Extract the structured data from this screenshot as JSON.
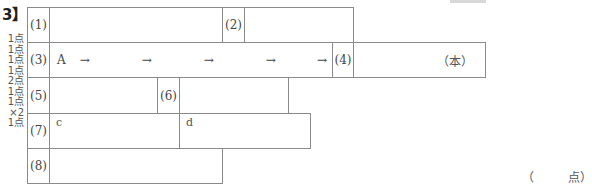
{
  "section": {
    "header": "3】",
    "scores": [
      "1点",
      "1点",
      "1点",
      "1点",
      "2点",
      "1点",
      "1点",
      "×2",
      "1点"
    ]
  },
  "questions": {
    "q1": {
      "label": "(1)",
      "answer": ""
    },
    "q2": {
      "label": "(2)",
      "answer": ""
    },
    "q3": {
      "label": "(3)",
      "start": "A",
      "arrow": "→",
      "end": "B",
      "blanks": [
        "",
        "",
        "",
        ""
      ]
    },
    "q4": {
      "label": "(4)",
      "answer": "",
      "unit": "（本）"
    },
    "q5": {
      "label": "(5)",
      "answer": ""
    },
    "q6": {
      "label": "(6)",
      "answer": ""
    },
    "q7": {
      "label": "(7)",
      "part_c": "c",
      "part_d": "d"
    },
    "q8": {
      "label": "(8)",
      "answer": ""
    }
  },
  "total": {
    "open": "（",
    "unit": "点）"
  }
}
